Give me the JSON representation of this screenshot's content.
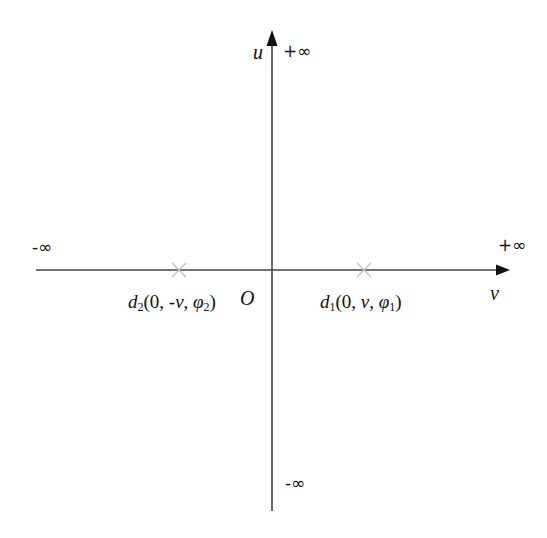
{
  "diagram": {
    "axes": {
      "vertical": {
        "label": "u",
        "top_end": "+∞",
        "bottom_end": "-∞"
      },
      "horizontal": {
        "label": "v",
        "left_end": "-∞",
        "right_end": "+∞"
      },
      "origin": "O"
    },
    "points": [
      {
        "id": "d2",
        "name": "d",
        "sub": "2",
        "coords_prefix": "(0, -",
        "var": "v",
        "sep": ", ",
        "phi": "φ",
        "phi_sub": "2",
        "close": ")",
        "marker": "cross"
      },
      {
        "id": "d1",
        "name": "d",
        "sub": "1",
        "coords_prefix": "(0, ",
        "var": "v",
        "sep": ", ",
        "phi": "φ",
        "phi_sub": "1",
        "close": ")",
        "marker": "cross"
      }
    ],
    "colors": {
      "axis": "#333333",
      "marker": "#bbbbbb",
      "text": "#111111"
    }
  }
}
